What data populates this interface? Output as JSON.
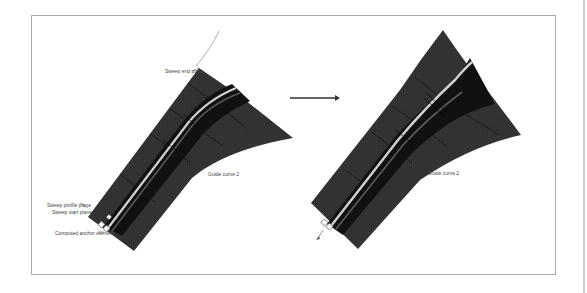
{
  "figure": {
    "arrow": {
      "direction": "right",
      "color": "#333333"
    },
    "left_panel": {
      "labels": {
        "sweep_end_plane": "Sweep end plane",
        "guide_curve_2": "Guide curve 2",
        "sweep_profile_plane": "Sweep profile plane",
        "sweep_start_plane": "Sweep start plane",
        "computed_anchor_element": "Computed anchor element"
      }
    },
    "right_panel": {
      "labels": {
        "guide_curve_2": "Guide curve 2"
      }
    },
    "colors": {
      "surface": "#2e2e2e",
      "surface_grid": "#111111",
      "tube_highlight": "#f2f2f2",
      "frame_border": "#a9a9a9",
      "guide_curve": "#9a9a9a"
    }
  }
}
